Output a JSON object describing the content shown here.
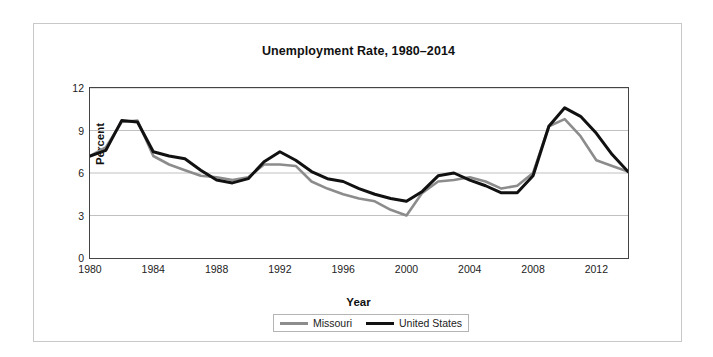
{
  "chart_data": {
    "type": "line",
    "title": "Unemployment Rate, 1980–2014",
    "xlabel": "Year",
    "ylabel": "Percent",
    "xlim": [
      1980,
      2014
    ],
    "ylim": [
      0,
      12
    ],
    "yticks": [
      0,
      3,
      6,
      9,
      12
    ],
    "ytick_labels": [
      "0",
      "3",
      "6",
      "9",
      "12"
    ],
    "xticks": [
      1980,
      1984,
      1988,
      1992,
      1996,
      2000,
      2004,
      2008,
      2012
    ],
    "xtick_labels": [
      "1980",
      "1984",
      "1988",
      "1992",
      "1996",
      "2000",
      "2004",
      "2008",
      "2012"
    ],
    "minor_xtick_interval": 1,
    "grid": "horizontal",
    "grid_color": "#c0c0c0",
    "legend_position": "bottom",
    "x": [
      1980,
      1981,
      1982,
      1983,
      1984,
      1985,
      1986,
      1987,
      1988,
      1989,
      1990,
      1991,
      1992,
      1993,
      1994,
      1995,
      1996,
      1997,
      1998,
      1999,
      2000,
      2001,
      2002,
      2003,
      2004,
      2005,
      2006,
      2007,
      2008,
      2009,
      2010,
      2011,
      2012,
      2013,
      2014
    ],
    "series": [
      {
        "name": "Missouri",
        "color": "#8c8c8c",
        "line_width": 2.6,
        "values": [
          7.2,
          7.8,
          9.6,
          9.7,
          7.2,
          6.6,
          6.2,
          5.8,
          5.7,
          5.5,
          5.7,
          6.6,
          6.6,
          6.5,
          5.4,
          4.9,
          4.5,
          4.2,
          4.0,
          3.4,
          3.0,
          4.6,
          5.4,
          5.5,
          5.7,
          5.4,
          4.9,
          5.1,
          6.0,
          9.3,
          9.8,
          8.6,
          6.9,
          6.5,
          6.1
        ]
      },
      {
        "name": "United States",
        "color": "#111111",
        "line_width": 3.0,
        "values": [
          7.2,
          7.6,
          9.7,
          9.6,
          7.5,
          7.2,
          7.0,
          6.2,
          5.5,
          5.3,
          5.6,
          6.8,
          7.5,
          6.9,
          6.1,
          5.6,
          5.4,
          4.9,
          4.5,
          4.2,
          4.0,
          4.7,
          5.8,
          6.0,
          5.5,
          5.1,
          4.6,
          4.6,
          5.8,
          9.3,
          10.6,
          10.0,
          8.8,
          7.3,
          6.1
        ]
      }
    ]
  },
  "legend": {
    "entries": [
      {
        "label": "Missouri"
      },
      {
        "label": "United States"
      }
    ]
  }
}
